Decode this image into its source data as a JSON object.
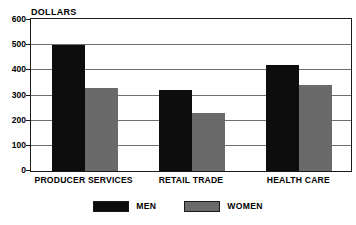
{
  "chart_data": {
    "type": "bar",
    "title": "DOLLARS",
    "xlabel": "",
    "ylabel": "DOLLARS",
    "ylim": [
      0,
      600
    ],
    "yticks": [
      0,
      100,
      200,
      300,
      400,
      500,
      600
    ],
    "ytick_labels": [
      "0",
      "100",
      "200",
      "300",
      "400",
      "500",
      "600"
    ],
    "grid": true,
    "legend_position": "bottom-center",
    "categories": [
      "PRODUCER SERVICES",
      "RETAIL TRADE",
      "HEALTH CARE"
    ],
    "series": [
      {
        "name": "MEN",
        "color": "#0d0d0d",
        "values": [
          500,
          320,
          420
        ]
      },
      {
        "name": "WOMEN",
        "color": "#6a6a6a",
        "values": [
          330,
          230,
          340
        ]
      }
    ]
  },
  "legend": {
    "entries": [
      {
        "label": "MEN"
      },
      {
        "label": "WOMEN"
      }
    ]
  },
  "colors": {
    "men": "#0d0d0d",
    "women": "#6a6a6a",
    "grid": "#6f6f6f",
    "frame": "#1a1a1a",
    "background": "#ffffff"
  }
}
